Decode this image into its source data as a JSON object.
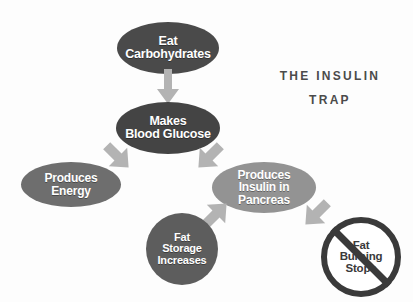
{
  "title": {
    "line1": "THE INSULIN",
    "line2": "TRAP"
  },
  "colors": {
    "background": "#fdfdfd",
    "node_dark": "#4a4a4a",
    "node_dark2": "#444444",
    "node_mid": "#6e6e6e",
    "node_light": "#939393",
    "node_fat_storage": "#5d5d5d",
    "prohibition_ring": "#3a3a3a",
    "arrow": "#b3b3b3",
    "text_on_node": "#ffffff",
    "title_text": "#4b4b4b"
  },
  "nodes": [
    {
      "id": "eat-carbohydrates",
      "shape": "ellipse",
      "lines": [
        "Eat",
        "Carbohydrates"
      ]
    },
    {
      "id": "makes-blood-glucose",
      "shape": "ellipse",
      "lines": [
        "Makes",
        "Blood Glucose"
      ]
    },
    {
      "id": "produces-energy",
      "shape": "ellipse",
      "lines": [
        "Produces",
        "Energy"
      ]
    },
    {
      "id": "produces-insulin-in-pancreas",
      "shape": "ellipse",
      "lines": [
        "Produces",
        "Insulin in",
        "Pancreas"
      ]
    },
    {
      "id": "fat-storage-increases",
      "shape": "circle",
      "lines": [
        "Fat",
        "Storage",
        "Increases"
      ]
    },
    {
      "id": "fat-burning-stops",
      "shape": "prohibition-circle",
      "lines": [
        "Fat",
        "Burning",
        "Stops"
      ]
    }
  ],
  "arrows": [
    {
      "id": "carb-to-glucose",
      "from": "eat-carbohydrates",
      "to": "makes-blood-glucose",
      "direction": "down"
    },
    {
      "id": "glucose-to-energy",
      "from": "makes-blood-glucose",
      "to": "produces-energy",
      "direction": "down-left"
    },
    {
      "id": "glucose-to-insulin",
      "from": "makes-blood-glucose",
      "to": "produces-insulin-in-pancreas",
      "direction": "down-right"
    },
    {
      "id": "insulin-to-fatstorage",
      "from": "produces-insulin-in-pancreas",
      "to": "fat-storage-increases",
      "direction": "down-left"
    },
    {
      "id": "insulin-to-fatburning",
      "from": "produces-insulin-in-pancreas",
      "to": "fat-burning-stops",
      "direction": "down-right"
    }
  ]
}
